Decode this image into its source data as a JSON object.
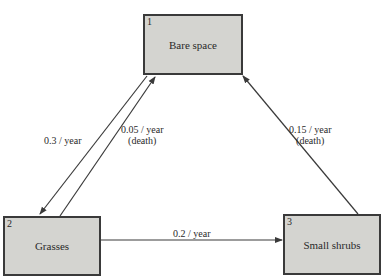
{
  "nodes": [
    {
      "id": "1",
      "label": "Bare space"
    },
    {
      "id": "2",
      "label": "Grasses"
    },
    {
      "id": "3",
      "label": "Small shrubs"
    }
  ],
  "edges": [
    {
      "from": "1",
      "to": "2",
      "rate": "0.3 / year",
      "note": ""
    },
    {
      "from": "2",
      "to": "1",
      "rate": "0.05 / year",
      "note": "(death)"
    },
    {
      "from": "3",
      "to": "1",
      "rate": "0.15 / year",
      "note": "(death)"
    },
    {
      "from": "2",
      "to": "3",
      "rate": "0.2 / year",
      "note": ""
    }
  ],
  "colors": {
    "box_fill": "#d4d4d0",
    "line": "#3a3a3a"
  }
}
